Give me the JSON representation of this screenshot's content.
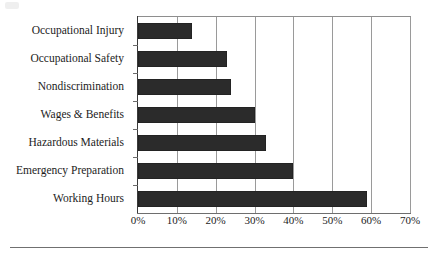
{
  "chart_data": {
    "type": "bar",
    "orientation": "horizontal",
    "title": "",
    "subtitle": "",
    "xlabel": "",
    "ylabel": "",
    "categories": [
      "Occupational Injury",
      "Occupational Safety",
      "Nondiscrimination",
      "Wages & Benefits",
      "Hazardous Materials",
      "Emergency Preparation",
      "Working Hours"
    ],
    "values": [
      14,
      23,
      24,
      30,
      33,
      40,
      59
    ],
    "value_suffix": "%",
    "xlim": [
      0,
      70
    ],
    "xticks": [
      0,
      10,
      20,
      30,
      40,
      50,
      60,
      70
    ],
    "xtick_labels": [
      "0%",
      "10%",
      "20%",
      "30%",
      "40%",
      "50%",
      "60%",
      "70%"
    ],
    "grid": "vertical",
    "legend": "none",
    "bar_color": "#2b2b2b",
    "gridline_color": "#9a9a9a",
    "axis_color": "#3a3a3a",
    "background_color": "#ffffff"
  }
}
